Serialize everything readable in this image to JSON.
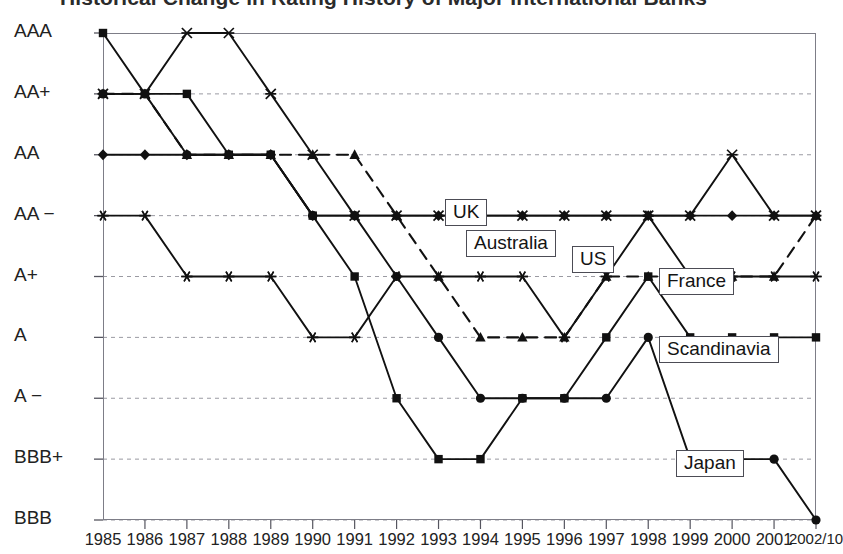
{
  "chart": {
    "title": "Historical Change in Rating History of Major International Banks"
  },
  "chart_data": {
    "type": "line",
    "title": "Historical Change in Rating History of Major International Banks",
    "xlabel": "",
    "ylabel": "",
    "grid": true,
    "legend_position": "inline-callouts",
    "x": [
      "1985",
      "1986",
      "1987",
      "1988",
      "1989",
      "1990",
      "1991",
      "1992",
      "1993",
      "1994",
      "1995",
      "1996",
      "1997",
      "1998",
      "1999",
      "2000",
      "2001",
      "2002/10"
    ],
    "y_categories": [
      "BBB",
      "BBB+",
      "A-",
      "A",
      "A+",
      "AA-",
      "AA",
      "AA+",
      "AAA"
    ],
    "ylim": [
      "BBB",
      "AAA"
    ],
    "series": [
      {
        "name": "Scandinavia",
        "marker": "square",
        "line": "solid",
        "values": [
          "AAA",
          "AA+",
          "AA+",
          "AA",
          "AA",
          "AA-",
          "A+",
          "A-",
          "BBB+",
          "BBB+",
          "A-",
          "A-",
          "A",
          "A+",
          "A",
          "A",
          "A",
          "A"
        ]
      },
      {
        "name": "US",
        "marker": "triangle",
        "line": "dashed",
        "values": [
          "AA+",
          "AA+",
          "AA",
          "AA",
          "AA",
          "AA",
          "AA",
          "AA-",
          "A+",
          "A",
          "A",
          "A",
          "A+",
          "A+",
          "A+",
          "A+",
          "A+",
          "AA-"
        ]
      },
      {
        "name": "UK",
        "marker": "cross",
        "line": "solid",
        "values": [
          "AA+",
          "AA+",
          "AAA",
          "AAA",
          "AA+",
          "AA",
          "AA-",
          "AA-",
          "AA-",
          "AA-",
          "AA-",
          "AA-",
          "AA-",
          "AA-",
          "AA-",
          "AA",
          "AA-",
          "AA-"
        ]
      },
      {
        "name": "Japan",
        "marker": "circle",
        "line": "solid",
        "values": [
          "AA+",
          "AA+",
          "AA",
          "AA",
          "AA",
          "AA-",
          "AA-",
          "A+",
          "A",
          "A-",
          "A-",
          "A-",
          "A-",
          "A",
          "BBB+",
          "BBB+",
          "BBB+",
          "BBB"
        ]
      },
      {
        "name": "Australia",
        "marker": "diamond",
        "line": "solid",
        "values": [
          "AA",
          "AA",
          "AA",
          "AA",
          "AA",
          "AA-",
          "AA-",
          "AA-",
          "AA-",
          "AA-",
          "AA-",
          "AA-",
          "AA-",
          "AA-",
          "AA-",
          "AA-",
          "AA-",
          "AA-"
        ]
      },
      {
        "name": "France",
        "marker": "asterisk",
        "line": "solid",
        "values": [
          "AA-",
          "AA-",
          "A+",
          "A+",
          "A+",
          "A",
          "A",
          "A+",
          "A+",
          "A+",
          "A+",
          "A",
          "A+",
          "AA-",
          "A+",
          "A+",
          "A+",
          "A+"
        ]
      }
    ],
    "callouts": [
      {
        "label": "UK"
      },
      {
        "label": "Australia"
      },
      {
        "label": "US"
      },
      {
        "label": "France"
      },
      {
        "label": "Scandinavia"
      },
      {
        "label": "Japan"
      }
    ]
  }
}
